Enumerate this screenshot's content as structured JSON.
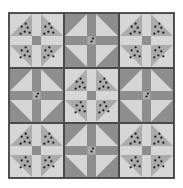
{
  "diagram": {
    "type": "quilt-pattern",
    "grid": {
      "rows": 3,
      "cols": 3
    },
    "colors": {
      "light": "#d6d6d6",
      "dark": "#8e8e8e",
      "dotted": "#ababab",
      "dot": "#1a1a1a",
      "border": "#4a4a4a"
    },
    "blocks": [
      {
        "row": 0,
        "col": 0,
        "type": "A"
      },
      {
        "row": 0,
        "col": 1,
        "type": "B"
      },
      {
        "row": 0,
        "col": 2,
        "type": "A"
      },
      {
        "row": 1,
        "col": 0,
        "type": "B"
      },
      {
        "row": 1,
        "col": 1,
        "type": "A"
      },
      {
        "row": 1,
        "col": 2,
        "type": "B"
      },
      {
        "row": 2,
        "col": 0,
        "type": "A"
      },
      {
        "row": 2,
        "col": 1,
        "type": "B"
      },
      {
        "row": 2,
        "col": 2,
        "type": "A"
      }
    ],
    "block_types": {
      "A": {
        "description": "Light quadrants with dotted half-square triangles pointing to center, light sashing, dark center square",
        "quadrant_outer": "light",
        "quadrant_inner": "dotted",
        "sashing": "light",
        "center": "dark"
      },
      "B": {
        "description": "Dark quadrants with light half-square triangles pointing to center, dark sashing, dotted light center square",
        "quadrant_outer": "dark",
        "quadrant_inner": "light",
        "sashing": "dark",
        "center": "dotted-light"
      }
    }
  }
}
